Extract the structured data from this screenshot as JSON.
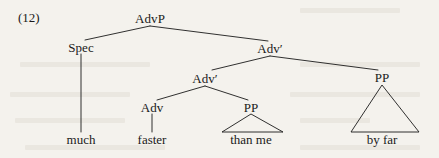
{
  "figure": {
    "example_number": "(12)",
    "type": "syntax-tree",
    "sentence": "much faster than me by far",
    "ink_color": "#1a1a1a",
    "background_color": "#f4f2ed"
  },
  "nodes": {
    "root": {
      "label": "AdvP",
      "x": 150,
      "y": 18
    },
    "spec": {
      "label": "Spec",
      "x": 81,
      "y": 47
    },
    "adv_bar_upper": {
      "label": "Adv′",
      "x": 270,
      "y": 48
    },
    "adv_bar_lower": {
      "label": "Adv′",
      "x": 205,
      "y": 78
    },
    "adv_head": {
      "label": "Adv",
      "x": 152,
      "y": 107
    },
    "pp_left": {
      "label": "PP",
      "x": 251,
      "y": 107
    },
    "pp_right": {
      "label": "PP",
      "x": 382,
      "y": 77
    }
  },
  "terminals": {
    "much": {
      "label": "much",
      "x": 81,
      "y": 139
    },
    "faster": {
      "label": "faster",
      "x": 152,
      "y": 139
    },
    "than_me": {
      "label": "than  me",
      "x": 251,
      "y": 139
    },
    "by_far": {
      "label": "by  far",
      "x": 382,
      "y": 139
    }
  },
  "edges": [
    {
      "name": "advp-to-spec",
      "x1": 150,
      "y1": 26,
      "x2": 85,
      "y2": 40
    },
    {
      "name": "advp-to-adv-bar-upper",
      "x1": 150,
      "y1": 26,
      "x2": 268,
      "y2": 41
    },
    {
      "name": "spec-to-much",
      "x1": 81,
      "y1": 54,
      "x2": 81,
      "y2": 132
    },
    {
      "name": "adv-bar-upper-to-adv-bar-lower",
      "x1": 270,
      "y1": 56,
      "x2": 212,
      "y2": 70
    },
    {
      "name": "adv-bar-upper-to-pp-right",
      "x1": 270,
      "y1": 56,
      "x2": 378,
      "y2": 70
    },
    {
      "name": "adv-bar-lower-to-adv-head",
      "x1": 205,
      "y1": 86,
      "x2": 157,
      "y2": 100
    },
    {
      "name": "adv-bar-lower-to-pp-left",
      "x1": 205,
      "y1": 86,
      "x2": 248,
      "y2": 100
    },
    {
      "name": "adv-head-to-faster",
      "x1": 152,
      "y1": 114,
      "x2": 152,
      "y2": 132
    }
  ],
  "triangles": [
    {
      "name": "pp-left-triangle",
      "apex_x": 251,
      "apex_y": 114,
      "left_x": 222,
      "right_x": 283,
      "base_y": 132
    },
    {
      "name": "pp-right-triangle",
      "apex_x": 382,
      "apex_y": 85,
      "left_x": 351,
      "right_x": 419,
      "base_y": 132
    }
  ]
}
